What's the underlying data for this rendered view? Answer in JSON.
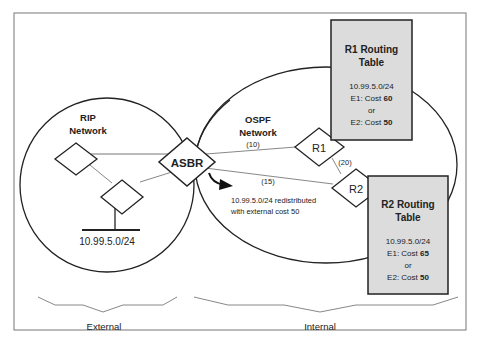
{
  "diagram": {
    "rip_network": {
      "line1": "RIP",
      "line2": "Network"
    },
    "ospf_network": {
      "line1": "OSPF",
      "line2": "Network"
    },
    "nodes": {
      "asbr": "ASBR",
      "r1": "R1",
      "r2": "R2"
    },
    "subnet": "10.99.5.0/24",
    "link_costs": {
      "asbr_r1": "(10)",
      "r1_r2": "(20)",
      "asbr_r2": "(15)"
    },
    "redistribution_note": {
      "line1": "10.99.5.0/24 redistributed",
      "line2": "with external cost 50"
    },
    "r1_table": {
      "title1": "R1 Routing",
      "title2": "Table",
      "prefix": "10.99.5.0/24",
      "e1_label": "E1: Cost ",
      "e1_value": "60",
      "or": "or",
      "e2_label": "E2: Cost ",
      "e2_value": "50"
    },
    "r2_table": {
      "title1": "R2 Routing",
      "title2": "Table",
      "prefix": "10.99.5.0/24",
      "e1_label": "E1: Cost ",
      "e1_value": "65",
      "or": "or",
      "e2_label": "E2: Cost ",
      "e2_value": "50"
    },
    "regions": {
      "external": "External",
      "internal": "Internal"
    },
    "colors": {
      "table_fill": "#dcdcdc",
      "line": "#222222",
      "link": "#888888",
      "brace": "#888888"
    }
  }
}
